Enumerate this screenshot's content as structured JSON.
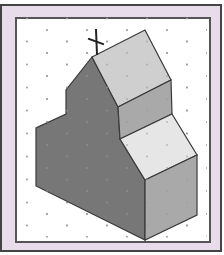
{
  "figure": {
    "grid": "isometric dot grid",
    "colors": {
      "frame_outer": "#444444",
      "frame_band": "#e9dcea",
      "panel": "#ffffff",
      "dot": "#9a9a9a",
      "roof_light": "#cfcfcf",
      "roof_lighter": "#e6e6e6",
      "face_medium": "#a9a9a9",
      "face_dark": "#777777",
      "edge": "#3a3a3a"
    },
    "cross": {
      "label": "cross-on-roof"
    }
  }
}
